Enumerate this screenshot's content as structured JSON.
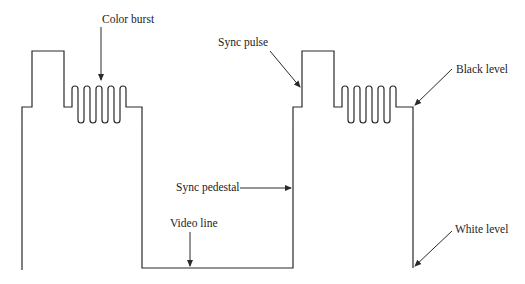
{
  "diagram": {
    "labels": {
      "color_burst": "Color burst",
      "sync_pulse": "Sync pulse",
      "black_level": "Black level",
      "sync_pedestal": "Sync pedestal",
      "video_line": "Video line",
      "white_level": "White level"
    },
    "colors": {
      "line": "#2a2a2a",
      "text": "#1c1c1c",
      "background": "#ffffff"
    },
    "levels_px": {
      "sync_top": 51,
      "burst_top": 86,
      "pedestal": 107,
      "burst_bottom": 123,
      "white_level": 268
    },
    "burst_cycles": 4
  }
}
